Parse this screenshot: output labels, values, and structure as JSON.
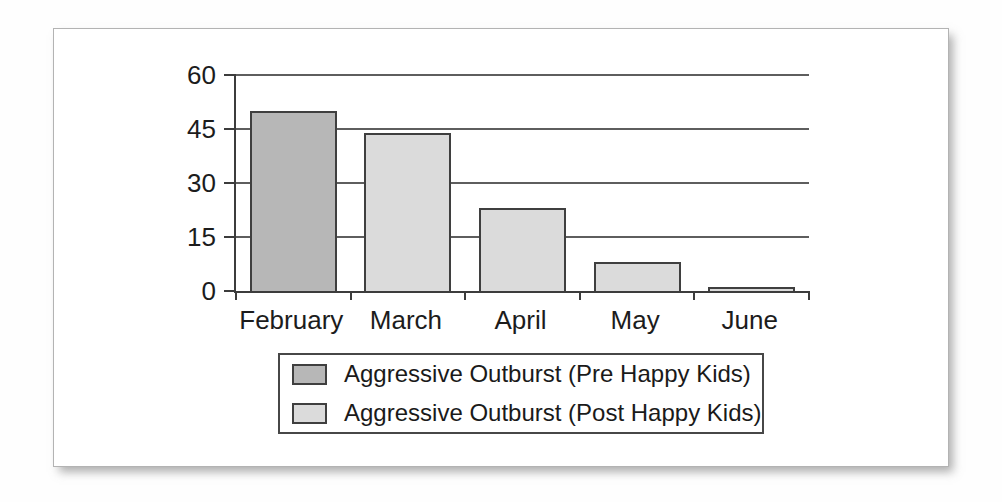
{
  "figure": {
    "background": "#ffffff",
    "frame_border_color": "#b3b3b3",
    "axis_color": "#3c3c3c",
    "bar_border_color": "#3f3f3f"
  },
  "chart_data": {
    "type": "bar",
    "title": "",
    "xlabel": "",
    "ylabel": "",
    "categories": [
      "February",
      "March",
      "April",
      "May",
      "June"
    ],
    "bars": [
      {
        "category": "February",
        "series": "Aggressive Outburst (Pre Happy Kids)",
        "value": 50
      },
      {
        "category": "March",
        "series": "Aggressive Outburst (Post Happy Kids)",
        "value": 44
      },
      {
        "category": "April",
        "series": "Aggressive Outburst (Post Happy Kids)",
        "value": 23
      },
      {
        "category": "May",
        "series": "Aggressive Outburst (Post Happy Kids)",
        "value": 8
      },
      {
        "category": "June",
        "series": "Aggressive Outburst (Post Happy Kids)",
        "value": 1
      }
    ],
    "series": [
      {
        "name": "Aggressive Outburst (Pre Happy Kids)",
        "color": "#b7b7b7"
      },
      {
        "name": "Aggressive Outburst (Post Happy Kids)",
        "color": "#dbdbdb"
      }
    ],
    "ylim": [
      0,
      60
    ],
    "yticks": [
      0,
      15,
      30,
      45,
      60
    ],
    "grid": true,
    "legend_position": "bottom-center"
  }
}
